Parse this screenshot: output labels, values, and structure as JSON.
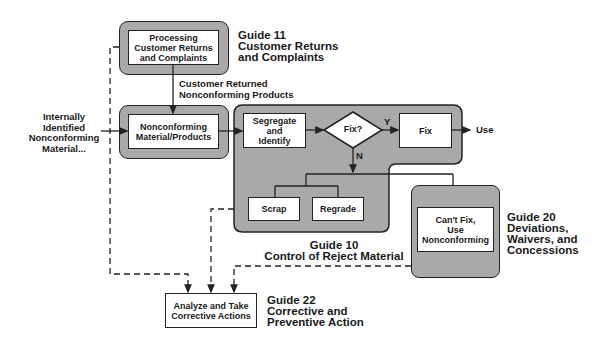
{
  "diagram": {
    "type": "flowchart",
    "colors": {
      "group_fill": "#a9a9a9",
      "box_fill": "#ffffff",
      "stroke": "#222222"
    },
    "groups": {
      "guide11": {
        "process": "Processing\nCustomer Returns\nand Complaints",
        "caption": "Guide 11\nCustomer Returns\nand Complaints"
      },
      "nonconforming": {
        "process": "Nonconforming\nMaterial/Products"
      },
      "guide10": {
        "segregate": "Segregate\nand\nIdentify",
        "decision": "Fix?",
        "yes_label": "Y",
        "no_label": "N",
        "fix": "Fix",
        "use": "Use",
        "scrap": "Scrap",
        "regrade": "Regrade",
        "caption": "Guide 10\nControl of Reject Material"
      },
      "guide20": {
        "process": "Can't Fix,\nUse\nNonconforming",
        "caption": "Guide 20\nDeviations,\nWaivers, and\nConcessions"
      },
      "guide22": {
        "process": "Analyze and Take\nCorrective Actions",
        "caption": "Guide 22\nCorrective and\nPreventive Action"
      }
    },
    "edge_labels": {
      "customer_returned": "Customer Returned\nNonconforming Products",
      "internal_input": "Internally\nIdentified\nNonconforming\nMaterial..."
    }
  }
}
